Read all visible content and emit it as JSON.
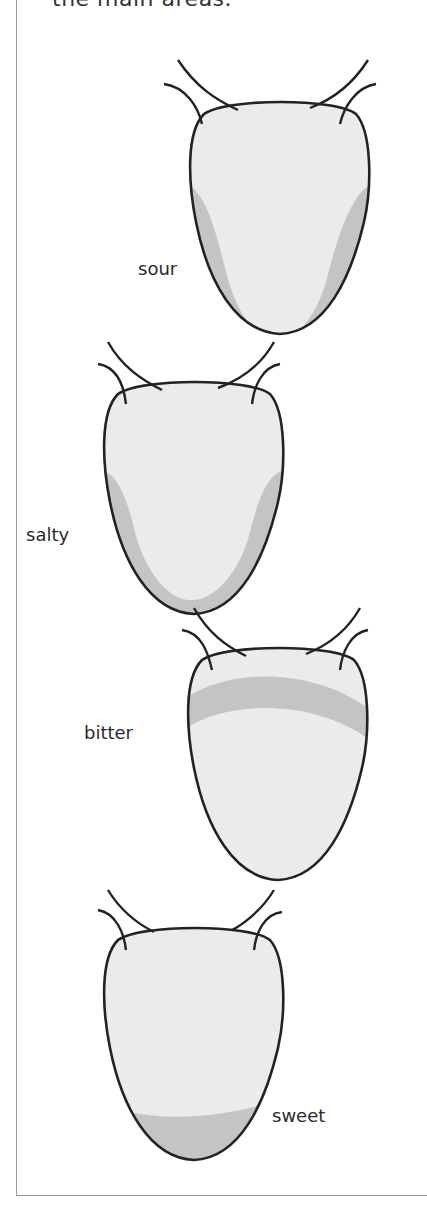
{
  "header": {
    "text": "the main areas."
  },
  "tongues": [
    {
      "label": "sour",
      "region": "sides-rear",
      "label_x": 138,
      "label_y": 260
    },
    {
      "label": "salty",
      "region": "sides-and-tip",
      "label_x": 26,
      "label_y": 526
    },
    {
      "label": "bitter",
      "region": "back-band",
      "label_x": 84,
      "label_y": 724
    },
    {
      "label": "sweet",
      "region": "tip",
      "label_x": 272,
      "label_y": 1107
    }
  ],
  "colors": {
    "tongue_fill": "#ebebeb",
    "highlight_fill": "#c4c4c4",
    "outline": "#222222",
    "border": "#9a9a9a"
  }
}
